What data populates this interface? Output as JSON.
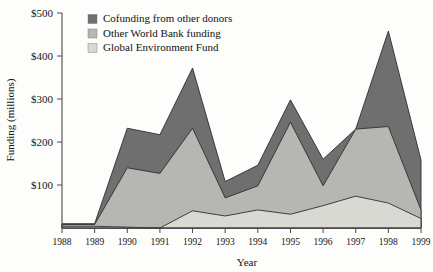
{
  "chart_data": {
    "type": "area",
    "stacked": true,
    "title": "",
    "subtitle": "",
    "xlabel": "Year",
    "ylabel": "Funding (millions)",
    "x": [
      1988,
      1989,
      1990,
      1991,
      1992,
      1993,
      1994,
      1995,
      1996,
      1997,
      1998,
      1999
    ],
    "categories": [
      "1988",
      "1989",
      "1990",
      "1991",
      "1992",
      "1993",
      "1994",
      "1995",
      "1996",
      "1997",
      "1998",
      "1999"
    ],
    "xtick_labels": [
      "1988",
      "1989",
      "1990",
      "1991",
      "1992",
      "1993",
      "1994",
      "1995",
      "1996",
      "1997",
      "1998",
      "1999"
    ],
    "ytick_labels": [
      "$100",
      "$200",
      "$300",
      "$400",
      "$500"
    ],
    "ytick_values": [
      100,
      200,
      300,
      400,
      500
    ],
    "ylim": [
      0,
      500
    ],
    "xlim": [
      1988,
      1999
    ],
    "grid": false,
    "legend_position": "top-left",
    "series": [
      {
        "name": "Global Environment Fund",
        "color": "#d9d9d4",
        "values": [
          4,
          4,
          2,
          0,
          40,
          28,
          42,
          32,
          52,
          74,
          58,
          22
        ]
      },
      {
        "name": "Other World Bank funding",
        "color": "#b6b6b2",
        "values": [
          4,
          4,
          138,
          127,
          192,
          42,
          56,
          214,
          46,
          156,
          178,
          20
        ]
      },
      {
        "name": "Cofunding from other donors",
        "color": "#6f6f6f",
        "values": [
          2,
          2,
          92,
          90,
          140,
          38,
          48,
          52,
          62,
          0,
          222,
          116
        ]
      }
    ],
    "series_order_bottom_to_top": [
      "Global Environment Fund",
      "Other World Bank funding",
      "Cofunding from other donors"
    ],
    "stack_tops": {
      "Global Environment Fund": [
        4,
        4,
        2,
        0,
        40,
        28,
        42,
        32,
        52,
        74,
        58,
        22
      ],
      "Other World Bank funding": [
        8,
        8,
        140,
        127,
        232,
        70,
        98,
        246,
        98,
        230,
        236,
        42
      ],
      "Cofunding from other donors": [
        10,
        10,
        232,
        217,
        372,
        108,
        146,
        298,
        160,
        382,
        458,
        158
      ]
    },
    "legend": [
      {
        "label": "Cofunding from other donors",
        "color": "#6f6f6f"
      },
      {
        "label": "Other World Bank funding",
        "color": "#b6b6b2"
      },
      {
        "label": "Global Environment Fund",
        "color": "#d9d9d4"
      }
    ],
    "axis_colors": {
      "line": "#4a4a4a",
      "text": "#161616"
    },
    "background": "#fdfdfb"
  }
}
